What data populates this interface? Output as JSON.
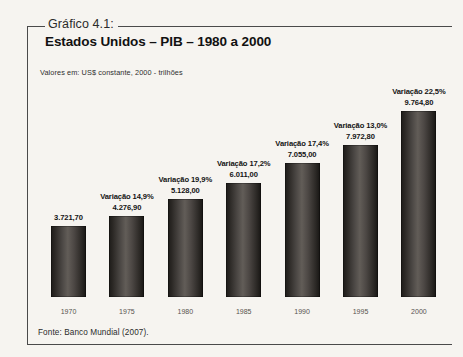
{
  "figure": {
    "caption_label": "Gráfico 4.1:",
    "title": "Estados Unidos – PIB – 1980 a 2000",
    "subtitle": "Valores em: US$ constante, 2000 - trilhões",
    "source": "Fonte: Banco Mundial (2007).",
    "frame_color": "#4a4a4a",
    "bar_color": "#3f3b38",
    "background_color": "#f6f4f0"
  },
  "chart_data": {
    "type": "bar",
    "title": "Estados Unidos – PIB – 1980 a 2000",
    "subtitle": "Valores em: US$ constante, 2000 - trilhões",
    "xlabel": "",
    "ylabel": "",
    "ylim": [
      0,
      10500
    ],
    "grid": false,
    "legend": null,
    "categories": [
      "1970",
      "1975",
      "1980",
      "1985",
      "1990",
      "1995",
      "2000"
    ],
    "values": [
      3721.7,
      4276.9,
      5128.0,
      6011.0,
      7055.0,
      7972.8,
      9764.8
    ],
    "value_labels": [
      "3.721,70",
      "4.276,90",
      "5.128,00",
      "6.011,00",
      "7.055,00",
      "7.972,80",
      "9.764,80"
    ],
    "annotations": [
      "",
      "Variação 14,9%",
      "Variação 19,9%",
      "Variação 17,2%",
      "Variação 17,4%",
      "Variação 13,0%",
      "Variação 22,5%"
    ],
    "bars": [
      {
        "category": "1970",
        "value": 3721.7,
        "value_label": "3.721,70",
        "annotation": ""
      },
      {
        "category": "1975",
        "value": 4276.9,
        "value_label": "4.276,90",
        "annotation": "Variação 14,9%"
      },
      {
        "category": "1980",
        "value": 5128.0,
        "value_label": "5.128,00",
        "annotation": "Variação 19,9%"
      },
      {
        "category": "1985",
        "value": 6011.0,
        "value_label": "6.011,00",
        "annotation": "Variação 17,2%"
      },
      {
        "category": "1990",
        "value": 7055.0,
        "value_label": "7.055,00",
        "annotation": "Variação 17,4%"
      },
      {
        "category": "1995",
        "value": 7972.8,
        "value_label": "7.972,80",
        "annotation": "Variação 13,0%"
      },
      {
        "category": "2000",
        "value": 9764.8,
        "value_label": "9.764,80",
        "annotation": "Variação 22,5%"
      }
    ]
  }
}
